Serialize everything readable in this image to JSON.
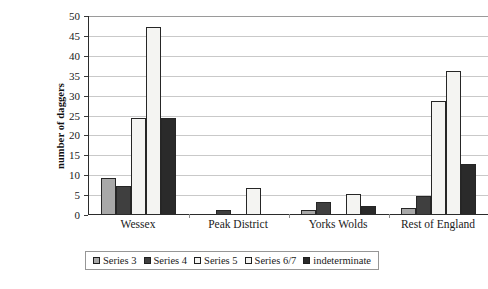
{
  "chart_data": {
    "type": "bar",
    "title": "",
    "xlabel": "",
    "ylabel": "number of daggers",
    "ylim": [
      0,
      50
    ],
    "ytick_step": 5,
    "yticks": [
      "0",
      "5",
      "10",
      "15",
      "20",
      "25",
      "30",
      "35",
      "40",
      "45",
      "50"
    ],
    "grid": true,
    "legend_position": "bottom",
    "categories": [
      "Wessex",
      "Peak District",
      "Yorks Wolds",
      "Rest of England"
    ],
    "series": [
      {
        "name": "Series 3",
        "color": "#a8a8a8",
        "values": [
          9,
          0,
          1,
          1.5
        ]
      },
      {
        "name": "Series 4",
        "color": "#3f3f3f",
        "values": [
          7,
          1,
          3,
          4.5
        ]
      },
      {
        "name": "Series 5",
        "color": "#f4f4f2",
        "values": [
          24,
          0,
          0,
          28.5
        ]
      },
      {
        "name": "Series 6/7",
        "color": "#f4f4f2",
        "values": [
          47,
          6.5,
          5,
          36
        ]
      },
      {
        "name": "indeterminate",
        "color": "#2a2a2a",
        "values": [
          24,
          0,
          2,
          12.5
        ]
      }
    ]
  },
  "caption": {
    "text": ""
  }
}
